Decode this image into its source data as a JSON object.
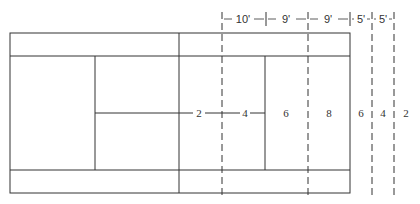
{
  "diagram": {
    "type": "tennis-court-half-with-zones",
    "dimensions_top": [
      "10'",
      "9'",
      "9'",
      "5'",
      "5'"
    ],
    "zone_labels": [
      "2",
      "4",
      "6",
      "8",
      "6",
      "4",
      "2"
    ],
    "colors": {
      "line": "#333333",
      "background": "#ffffff"
    }
  }
}
